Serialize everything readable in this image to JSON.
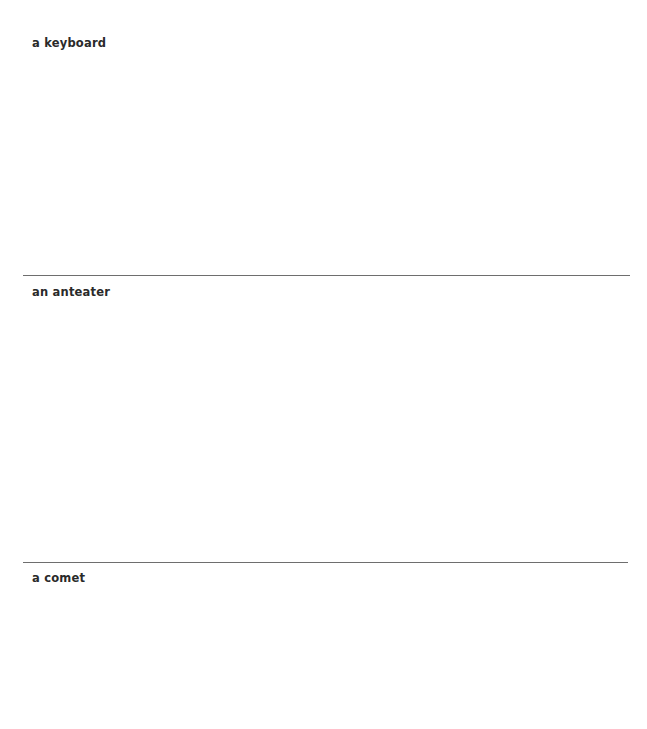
{
  "sections": [
    {
      "label": "a keyboard"
    },
    {
      "label": "an anteater"
    },
    {
      "label": "a comet"
    }
  ]
}
